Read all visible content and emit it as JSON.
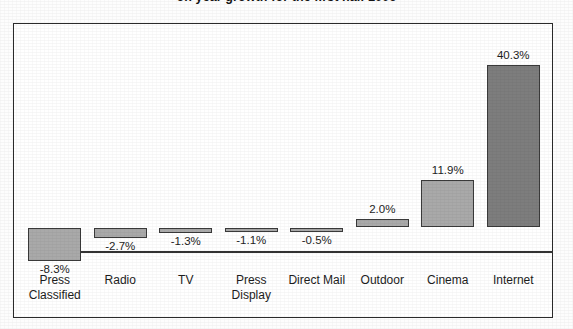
{
  "chart_data": {
    "type": "bar",
    "title": "on year growth for the first half 2006",
    "xlabel": "",
    "ylabel": "",
    "categories": [
      "Press Classified",
      "Radio",
      "TV",
      "Press Display",
      "Direct Mail",
      "Outdoor",
      "Cinema",
      "Internet"
    ],
    "category_lines": [
      [
        "Press",
        "Classified"
      ],
      [
        "Radio",
        ""
      ],
      [
        "TV",
        ""
      ],
      [
        "Press",
        "Display"
      ],
      [
        "Direct Mail",
        ""
      ],
      [
        "Outdoor",
        ""
      ],
      [
        "Cinema",
        ""
      ],
      [
        "Internet",
        ""
      ]
    ],
    "values": [
      -8.3,
      -2.7,
      -1.3,
      -1.1,
      -0.5,
      2.0,
      11.9,
      40.3
    ],
    "value_labels": [
      "-8.3%",
      "-2.7%",
      "-1.3%",
      "-1.1%",
      "-0.5%",
      "2.0%",
      "11.9%",
      "40.3%"
    ],
    "ylim": [
      -9.5,
      44.0
    ],
    "grid": false,
    "legend": null,
    "series": [
      {
        "name": "Year on year growth",
        "values": [
          -8.3,
          -2.7,
          -1.3,
          -1.1,
          -0.5,
          2.0,
          11.9,
          40.3
        ]
      }
    ],
    "colors": {
      "bar_light": "#a9a9a9",
      "bar_dark": "#7d7d7d",
      "bar_border": "#3a3a3a",
      "axis": "#333333",
      "frame": "#2b2b2b",
      "text": "#1d1d1d"
    },
    "highlight_category": "Internet"
  }
}
